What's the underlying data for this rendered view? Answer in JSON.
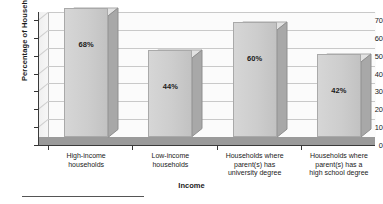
{
  "chart_data": {
    "type": "bar",
    "title": "",
    "xlabel": "Income",
    "ylabel": "Percentage of Households",
    "categories": [
      "High-income households",
      "Low-income households",
      "Households where parent(s) has university degree",
      "Households where parent(s) has a high school degree"
    ],
    "category_lines": [
      [
        "High-income",
        "households"
      ],
      [
        "Low-income",
        "households"
      ],
      [
        "Households where",
        "parent(s) has",
        "university degree"
      ],
      [
        "Households where",
        "parent(s) has a",
        "high school degree"
      ]
    ],
    "values": [
      68,
      44,
      60,
      42
    ],
    "data_labels": [
      "68%",
      "44%",
      "60%",
      "42%"
    ],
    "ylim": [
      0,
      70
    ],
    "yticks": [
      0,
      10,
      20,
      30,
      40,
      50,
      60,
      70
    ],
    "ytick_labels": [
      "0",
      "10",
      "20",
      "30",
      "40",
      "50",
      "60",
      "70"
    ],
    "grid": true,
    "legend": false,
    "style": "3d-column"
  },
  "colors": {
    "bar_face": "#cdcdcd",
    "bar_top": "#e2e2e2",
    "bar_side": "#a8a8a8",
    "floor": "#9a9a9a",
    "gridline": "#c9c9c9",
    "axis": "#3a3a3a",
    "text": "#1a1a1a",
    "plot_background": "#fbfbfb",
    "page_background": "#ffffff"
  }
}
